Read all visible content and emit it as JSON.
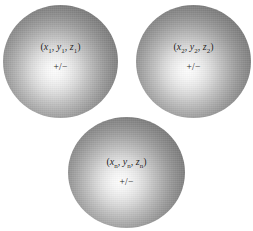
{
  "figure": {
    "type": "diagram",
    "background_color": "#ffffff",
    "sphere_rim_color": "#6a6a6a",
    "sphere_highlight_color": "#fdfdfd",
    "text_color": "#1c1c1c"
  },
  "spheres": [
    {
      "id": "sphere-1",
      "coord_prefix": "(",
      "x_var": "x",
      "x_sub": "1",
      "sep1": ", ",
      "y_var": "y",
      "y_sub": "1",
      "sep2": ", ",
      "z_var": "z",
      "z_sub": "1",
      "coord_suffix": ")",
      "charge": "+/−"
    },
    {
      "id": "sphere-2",
      "coord_prefix": "(",
      "x_var": "x",
      "x_sub": "2",
      "sep1": ", ",
      "y_var": "y",
      "y_sub": "2",
      "sep2": ", ",
      "z_var": "z",
      "z_sub": "2",
      "coord_suffix": ")",
      "charge": "+/−"
    },
    {
      "id": "sphere-3",
      "coord_prefix": "(",
      "x_var": "x",
      "x_sub": "n",
      "sep1": ", ",
      "y_var": "y",
      "y_sub": "n",
      "sep2": ", ",
      "z_var": "z",
      "z_sub": "n",
      "coord_suffix": ")",
      "charge": "+/−"
    }
  ]
}
